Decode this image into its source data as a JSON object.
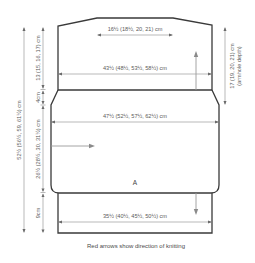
{
  "diagram": {
    "piece_label": "A",
    "caption": "Red arrows show direction of knitting",
    "colors": {
      "outline": "#3a3a3a",
      "dimension_line": "#8a8a8a",
      "knitting_arrow": "#9a9a9a",
      "text": "#5a5a5a",
      "background": "#ffffff"
    },
    "horizontal_measurements": {
      "neck_width": "16½ (18½, 20, 21) cm",
      "shoulder_width": "43½ (48½, 53½, 58½) cm",
      "body_width": "47½ (52½, 57½, 62½) cm",
      "rib_width": "35½ (40½, 45½, 50½) cm"
    },
    "vertical_measurements": {
      "total_length": "52½ (56½, 59, 61½) cm",
      "upper_section": "13 (15, 16, 17) cm",
      "shaping_section": "4cm",
      "body_section": "26½ (28½, 30, 31½) cm",
      "rib_section": "9cm",
      "armhole_depth_line1": "17 (19, 20, 21) cm",
      "armhole_depth_line2": "(armhole depth)"
    },
    "knitting_arrows": [
      {
        "direction": "up",
        "name": "upper-section"
      },
      {
        "direction": "right",
        "name": "body-section"
      },
      {
        "direction": "down",
        "name": "rib-section"
      }
    ]
  }
}
